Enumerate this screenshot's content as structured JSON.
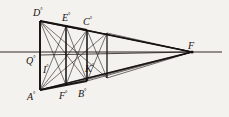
{
  "figure": {
    "width": 229,
    "height": 117,
    "background_color": "#f4f2ee",
    "ink_color": "#141110",
    "horizon_color": "#5a5550"
  },
  "labels": {
    "D": {
      "text": "D",
      "degree": "°",
      "x": 33,
      "y": 7
    },
    "E": {
      "text": "E",
      "degree": "°",
      "x": 62,
      "y": 12
    },
    "C": {
      "text": "C",
      "degree": "°",
      "x": 83,
      "y": 16
    },
    "F_vanishing": {
      "text": "F",
      "degree": "",
      "x": 188,
      "y": 40
    },
    "Q": {
      "text": "Q",
      "degree": "°",
      "x": 26,
      "y": 55
    },
    "I": {
      "text": "I",
      "degree": "°",
      "x": 43,
      "y": 64
    },
    "K": {
      "text": "K",
      "degree": "°",
      "x": 85,
      "y": 63
    },
    "A": {
      "text": "A",
      "degree": "°",
      "x": 27,
      "y": 91
    },
    "F_base": {
      "text": "F",
      "degree": "°",
      "x": 59,
      "y": 90
    },
    "B": {
      "text": "B",
      "degree": "°",
      "x": 78,
      "y": 88
    }
  },
  "chart_data": {
    "type": "diagram",
    "vanishing_point": {
      "name": "F",
      "x": 192,
      "y": 52
    },
    "horizon_line": {
      "y": 52,
      "x_start": 0,
      "x_end": 222
    },
    "verticals": [
      {
        "name": "AD",
        "x": 40,
        "y_top": 21,
        "y_bottom": 90
      },
      {
        "name": "F0E",
        "x": 66,
        "y_top": 26,
        "y_bottom": 85
      },
      {
        "name": "B0C",
        "x": 87,
        "y_top": 30,
        "y_bottom": 81
      },
      {
        "name": "right-edge",
        "x": 107,
        "y_top": 33,
        "y_bottom": 78
      }
    ],
    "edges": [
      {
        "name": "top-receding",
        "from": [
          40,
          21
        ],
        "to": [
          192,
          52
        ]
      },
      {
        "name": "bottom-receding",
        "from": [
          40,
          90
        ],
        "to": [
          192,
          52
        ]
      },
      {
        "name": "mid-receding",
        "from": [
          40,
          55
        ],
        "to": [
          192,
          52
        ]
      }
    ],
    "diagonals": [
      {
        "from": [
          40,
          21
        ],
        "to": [
          66,
          85
        ]
      },
      {
        "from": [
          40,
          21
        ],
        "to": [
          87,
          81
        ]
      },
      {
        "from": [
          40,
          90
        ],
        "to": [
          66,
          26
        ]
      },
      {
        "from": [
          40,
          90
        ],
        "to": [
          87,
          30
        ]
      },
      {
        "from": [
          40,
          90
        ],
        "to": [
          107,
          33
        ]
      },
      {
        "from": [
          40,
          21
        ],
        "to": [
          107,
          78
        ]
      },
      {
        "from": [
          66,
          26
        ],
        "to": [
          87,
          81
        ]
      },
      {
        "from": [
          66,
          85
        ],
        "to": [
          87,
          30
        ]
      },
      {
        "from": [
          87,
          30
        ],
        "to": [
          107,
          78
        ]
      },
      {
        "from": [
          87,
          81
        ],
        "to": [
          107,
          33
        ]
      }
    ]
  }
}
